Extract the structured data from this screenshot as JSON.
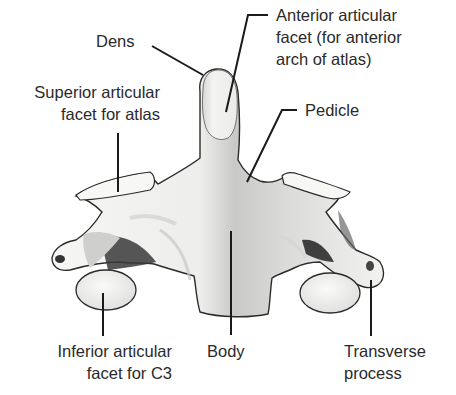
{
  "figure": {
    "colors": {
      "outline": "#2b2b2b",
      "bone_light": "#f4f4f2",
      "bone_mid": "#d6d6d4",
      "bone_shadow": "#a9a9a7",
      "bone_dark": "#3a3a3a",
      "leader": "#1a1a1a",
      "text": "#2a2a2a"
    }
  },
  "labels": {
    "dens": {
      "lines": [
        "Dens"
      ]
    },
    "anterior_facet": {
      "lines": [
        "Anterior articular",
        "facet (for anterior",
        "arch of atlas)"
      ]
    },
    "superior_facet": {
      "lines": [
        "Superior articular",
        "facet for atlas"
      ]
    },
    "pedicle": {
      "lines": [
        "Pedicle"
      ]
    },
    "inferior_facet": {
      "lines": [
        "Inferior articular",
        "facet for C3"
      ]
    },
    "body": {
      "lines": [
        "Body"
      ]
    },
    "transverse_process": {
      "lines": [
        "Transverse",
        "process"
      ]
    }
  }
}
